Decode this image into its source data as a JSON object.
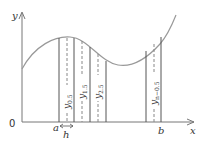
{
  "diagram": {
    "axes": {
      "y_label": "y",
      "x_label": "x",
      "origin_label": "0"
    },
    "interval": {
      "start_label": "a",
      "end_label": "b",
      "step_label": "h"
    },
    "ordinates": [
      {
        "label": "y",
        "sub": "0.5"
      },
      {
        "label": "y",
        "sub": "1.5"
      },
      {
        "label": "y",
        "sub": "2.5"
      },
      {
        "label": "y",
        "sub": "n−0.5"
      }
    ],
    "colors": {
      "curve": "#999999",
      "axes": "#777777",
      "strip_lines": "#555555",
      "midlines": "#888888",
      "text": "#333333"
    }
  }
}
